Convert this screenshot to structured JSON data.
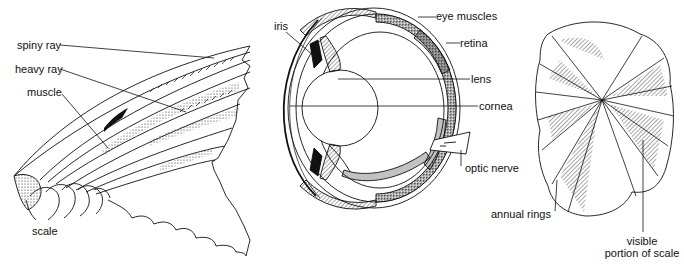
{
  "panels": {
    "fin": {
      "labels": {
        "spiny_ray": "spiny ray",
        "heavy_ray": "heavy ray",
        "muscle": "muscle",
        "scale": "scale"
      }
    },
    "eye": {
      "labels": {
        "iris": "iris",
        "eye_muscles": "eye muscles",
        "retina": "retina",
        "lens": "lens",
        "cornea": "cornea",
        "optic_nerve": "optic nerve"
      }
    },
    "scale_detail": {
      "labels": {
        "annual_rings": "annual rings",
        "visible_line1": "visible",
        "visible_line2": "portion of scale"
      }
    }
  },
  "colors": {
    "ink": "#111111",
    "paper": "#ffffff",
    "shade": "#555555"
  }
}
